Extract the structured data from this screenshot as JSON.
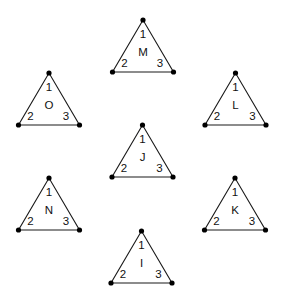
{
  "diagram": {
    "corner_labels": [
      "1",
      "2",
      "3"
    ],
    "line_color": "#1a1a1a",
    "dot_color": "#000000",
    "triangles": [
      {
        "id": "M",
        "letter": "M",
        "position": "top",
        "apex": [
          143,
          20
        ]
      },
      {
        "id": "O",
        "letter": "O",
        "position": "upper-left",
        "apex": [
          49,
          73
        ]
      },
      {
        "id": "L",
        "letter": "L",
        "position": "upper-right",
        "apex": [
          235.5,
          73
        ]
      },
      {
        "id": "J",
        "letter": "J",
        "position": "center",
        "apex": [
          142.5,
          125
        ]
      },
      {
        "id": "N",
        "letter": "N",
        "position": "lower-left",
        "apex": [
          49,
          178
        ]
      },
      {
        "id": "K",
        "letter": "K",
        "position": "lower-right",
        "apex": [
          235,
          178
        ]
      },
      {
        "id": "I",
        "letter": "I",
        "position": "bottom",
        "apex": [
          141.5,
          231
        ]
      }
    ]
  }
}
